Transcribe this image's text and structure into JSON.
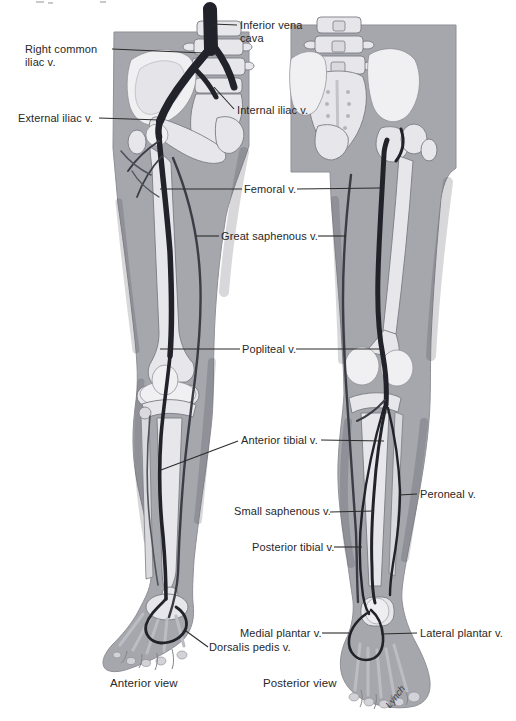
{
  "labels": {
    "inferior_vena_cava": "Inferior vena cava",
    "right_common_iliac": "Right common iliac v.",
    "external_iliac": "External iliac v.",
    "internal_iliac": "Internal iliac v.",
    "femoral": "Femoral v.",
    "great_saphenous": "Great saphenous v.",
    "popliteal": "Popliteal v.",
    "anterior_tibial": "Anterior tibial v.",
    "peroneal": "Peroneal v.",
    "small_saphenous": "Small saphenous v.",
    "posterior_tibial": "Posterior tibial v.",
    "medial_plantar": "Medial plantar v.",
    "lateral_plantar": "Lateral plantar v.",
    "dorsalis_pedis": "Dorsalis pedis v."
  },
  "captions": {
    "anterior_view": "Anterior view",
    "posterior_view": "Posterior view"
  },
  "signature": "Lynch",
  "colors": {
    "vein_dark": "#22222b",
    "vein_mid": "#3c3c46",
    "silhouette_gray": "#a6a6ad",
    "bone_light": "#e7e7eb",
    "label_text": "#282828",
    "background": "#ffffff"
  }
}
